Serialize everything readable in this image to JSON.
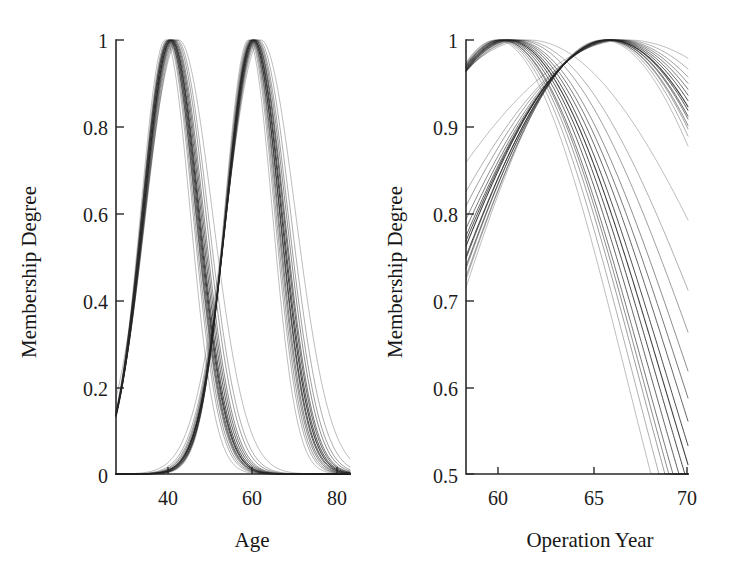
{
  "figure": {
    "background_color": "#ffffff",
    "line_color": "#232323",
    "axis_color": "#2a2a2a"
  },
  "chart_data": [
    {
      "id": "age-membership",
      "type": "line",
      "title": "",
      "xlabel": "Age",
      "ylabel": "Membership Degree",
      "xlim": [
        30,
        83
      ],
      "ylim": [
        0,
        1
      ],
      "xticks": [
        40,
        60,
        80
      ],
      "xtick_labels": [
        "40",
        "60",
        "80"
      ],
      "yticks": [
        0,
        0.2,
        0.4,
        0.6,
        0.8,
        1
      ],
      "ytick_labels": [
        "0",
        "0.2",
        "0.4",
        "0.6",
        "0.8",
        "1"
      ],
      "grid": false,
      "legend": "none",
      "description": "Two bundles of Gaussian membership functions over patient Age; left bundle peaks near 42, right bundle peaks near 61; bundles cross near Age 52 at membership 0.60",
      "series": [
        {
          "name": "low-age-cluster",
          "shape": "gaussian",
          "centers": [
            41.2,
            41.6,
            41.8,
            42.0,
            42.0,
            42.2,
            42.3,
            42.5,
            42.6,
            42.8,
            43.0,
            43.2,
            43.5,
            43.8,
            44.2
          ],
          "sigmas": [
            5.6,
            5.8,
            5.9,
            6.0,
            6.1,
            6.1,
            6.2,
            6.2,
            6.3,
            6.4,
            6.5,
            6.6,
            6.8,
            7.0,
            7.6
          ],
          "peak_value": 1.0
        },
        {
          "name": "high-age-cluster",
          "shape": "gaussian",
          "centers": [
            60.0,
            60.3,
            60.5,
            60.7,
            60.8,
            61.0,
            61.0,
            61.2,
            61.3,
            61.5,
            61.6,
            61.8,
            62.0,
            62.3,
            62.8
          ],
          "sigmas": [
            5.4,
            5.6,
            5.7,
            5.8,
            5.9,
            6.0,
            6.1,
            6.2,
            6.3,
            6.4,
            6.5,
            6.7,
            6.9,
            7.2,
            7.8
          ],
          "peak_value": 1.0
        }
      ]
    },
    {
      "id": "operation-year-membership",
      "type": "line",
      "title": "",
      "xlabel": "Operation Year",
      "ylabel": "Membership Degree",
      "xlim": [
        57.5,
        70
      ],
      "ylim": [
        0.5,
        1
      ],
      "xticks": [
        60,
        65,
        70
      ],
      "xtick_labels": [
        "60",
        "65",
        "70"
      ],
      "yticks": [
        0.5,
        0.6,
        0.7,
        0.8,
        0.9,
        1
      ],
      "ytick_labels": [
        "0.5",
        "0.6",
        "0.7",
        "0.8",
        "0.9",
        "1"
      ],
      "grid": false,
      "legend": "none",
      "description": "Two bundles of Gaussian membership functions over Operation Year; descending bundle peaks near 59.5 and falls to about 0.60-0.72 by year 69; ascending bundle rises from about 0.73-0.85 at year 57.5 and peaks near 65.5; the bundles cross near year 62 at membership 0.985",
      "series": [
        {
          "name": "early-year-cluster",
          "shape": "gaussian",
          "centers": [
            59.2,
            59.3,
            59.4,
            59.5,
            59.5,
            59.6,
            59.7,
            59.8,
            59.9,
            60.0,
            60.1,
            60.2,
            60.4,
            60.6,
            61.0
          ],
          "sigmas": [
            7.4,
            7.7,
            7.9,
            8.0,
            8.2,
            8.4,
            8.6,
            8.8,
            9.0,
            9.3,
            9.6,
            10.0,
            10.6,
            11.4,
            13.2
          ],
          "peak_value": 1.0
        },
        {
          "name": "late-year-cluster",
          "shape": "gaussian",
          "centers": [
            65.2,
            65.3,
            65.4,
            65.4,
            65.5,
            65.5,
            65.6,
            65.6,
            65.7,
            65.8,
            65.9,
            66.0,
            66.1,
            66.3,
            66.6
          ],
          "sigmas": [
            9.4,
            9.7,
            9.9,
            10.1,
            10.3,
            10.5,
            10.7,
            11.0,
            11.3,
            11.6,
            12.0,
            12.5,
            13.2,
            14.2,
            16.5
          ],
          "peak_value": 1.0
        }
      ]
    }
  ],
  "panels": {
    "left": {
      "ylabel": "Membership Degree",
      "xlabel": "Age",
      "xtick_labels": [
        "40",
        "60",
        "80"
      ],
      "ytick_labels": [
        "1",
        "0.8",
        "0.6",
        "0.4",
        "0.2",
        "0"
      ]
    },
    "right": {
      "ylabel": "Membership Degree",
      "xlabel": "Operation Year",
      "xtick_labels": [
        "60",
        "65",
        "70"
      ],
      "ytick_labels": [
        "1",
        "0.9",
        "0.8",
        "0.7",
        "0.6",
        "0.5"
      ]
    }
  }
}
